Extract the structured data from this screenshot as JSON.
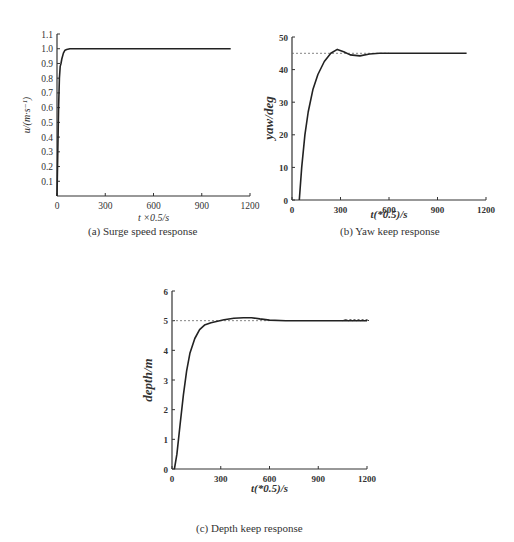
{
  "chart_data": [
    {
      "id": "a",
      "type": "line",
      "title": "(a) Surge speed response",
      "xlabel": "t ×0.5/s",
      "ylabel": "u/(m·s⁻¹)",
      "xlim": [
        0,
        1200
      ],
      "ylim": [
        0,
        1.1
      ],
      "xticks": [
        "0",
        "300",
        "600",
        "900",
        "1200"
      ],
      "yticks": [
        "0.1",
        "0.2",
        "0.3",
        "0.4",
        "0.5",
        "0.6",
        "0.7",
        "0.8",
        "0.9",
        "1.0",
        "1.1"
      ],
      "grid": false,
      "series": [
        {
          "name": "surge speed",
          "x": [
            0,
            5,
            10,
            15,
            20,
            25,
            30,
            40,
            50,
            60,
            80,
            100,
            300,
            600,
            900,
            1080
          ],
          "y": [
            0,
            0.3,
            0.6,
            0.8,
            0.88,
            0.9,
            0.93,
            0.97,
            0.99,
            0.995,
            1.0,
            1.0,
            1.0,
            1.0,
            1.0,
            1.0
          ]
        }
      ]
    },
    {
      "id": "b",
      "type": "line",
      "title": "(b) Yaw keep response",
      "xlabel": "t(*0.5)/s",
      "ylabel": "yaw/deg",
      "xlim": [
        0,
        1200
      ],
      "ylim": [
        0,
        50
      ],
      "xticks": [
        "0",
        "300",
        "600",
        "900",
        "1200"
      ],
      "yticks": [
        "0",
        "10",
        "20",
        "30",
        "40",
        "50"
      ],
      "grid": false,
      "reference": 45,
      "series": [
        {
          "name": "yaw",
          "x": [
            45,
            60,
            80,
            100,
            130,
            160,
            200,
            240,
            280,
            320,
            360,
            420,
            480,
            540,
            600,
            900,
            1080
          ],
          "y": [
            0,
            10,
            20,
            27,
            34,
            38.5,
            42.5,
            45,
            46.2,
            45.5,
            44.5,
            44.2,
            44.8,
            45,
            45,
            45,
            45
          ]
        }
      ]
    },
    {
      "id": "c",
      "type": "line",
      "title": "(c) Depth keep response",
      "xlabel": "t(*0.5)/s",
      "ylabel": "depth/m",
      "xlim": [
        0,
        1200
      ],
      "ylim": [
        0,
        6
      ],
      "xticks": [
        "0",
        "300",
        "600",
        "900",
        "1200"
      ],
      "yticks": [
        "0",
        "1",
        "2",
        "3",
        "4",
        "5",
        "6"
      ],
      "grid": false,
      "reference": 5,
      "series": [
        {
          "name": "depth",
          "x": [
            15,
            30,
            50,
            70,
            90,
            110,
            140,
            170,
            200,
            240,
            280,
            320,
            380,
            440,
            490,
            540,
            600,
            700,
            900,
            1050,
            1200
          ],
          "y": [
            0,
            0.5,
            1.5,
            2.5,
            3.3,
            3.9,
            4.4,
            4.7,
            4.85,
            4.93,
            4.98,
            5.03,
            5.08,
            5.1,
            5.1,
            5.06,
            5.02,
            5.0,
            5.0,
            5.0,
            5.0
          ]
        }
      ]
    }
  ]
}
